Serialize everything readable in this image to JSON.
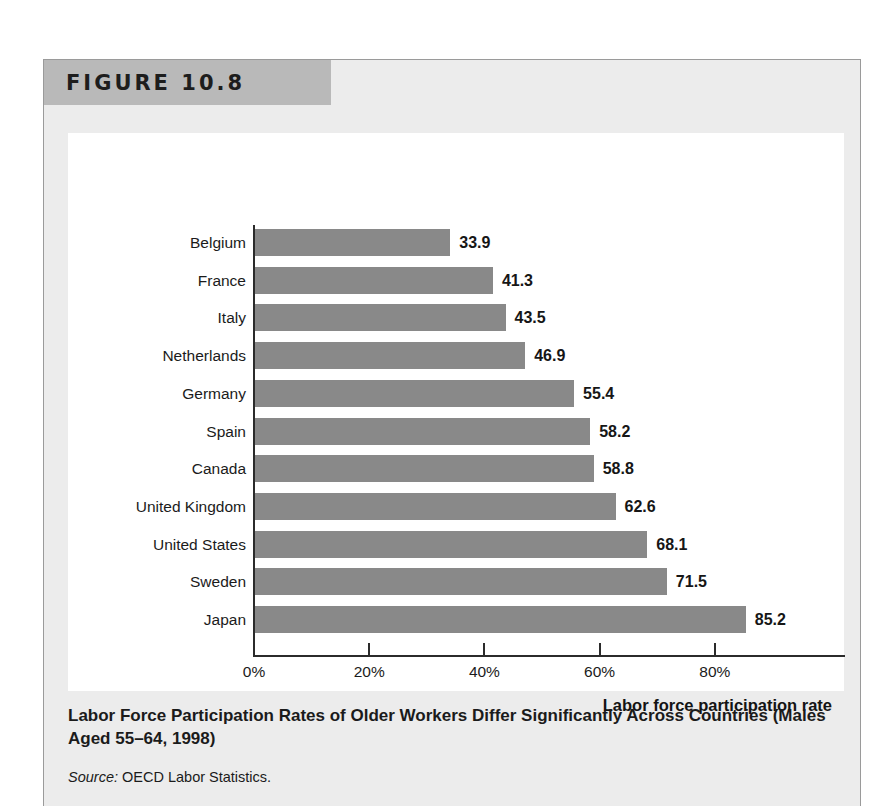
{
  "figure": {
    "number_label": "FIGURE 10.8",
    "caption": "Labor Force Participation Rates of Older Workers Differ Significantly Across Countries (Males Aged 55–64, 1998)",
    "source_prefix": "Source:",
    "source_text": " OECD Labor Statistics."
  },
  "colors": {
    "bar": "#898989",
    "banner": "#b9b9b9",
    "figure_background": "#ececec",
    "plot_background": "#ffffff",
    "axis": "#2b2b2b",
    "text": "#1b1b1b"
  },
  "chart_data": {
    "type": "bar",
    "orientation": "horizontal",
    "title": "",
    "subtitle": "",
    "xlabel": "Labor force participation rate",
    "ylabel": "",
    "xlim": [
      0,
      100
    ],
    "xticks": [
      0,
      20,
      40,
      60,
      80
    ],
    "xticklabels": [
      "0%",
      "20%",
      "40%",
      "60%",
      "80%"
    ],
    "grid": false,
    "legend": false,
    "value_labels": true,
    "categories": [
      "Belgium",
      "France",
      "Italy",
      "Netherlands",
      "Germany",
      "Spain",
      "Canada",
      "United Kingdom",
      "United States",
      "Sweden",
      "Japan"
    ],
    "values": [
      33.9,
      41.3,
      43.5,
      46.9,
      55.4,
      58.2,
      58.8,
      62.6,
      68.1,
      71.5,
      85.2
    ],
    "value_label_texts": [
      "33.9",
      "41.3",
      "43.5",
      "46.9",
      "55.4",
      "58.2",
      "58.8",
      "62.6",
      "68.1",
      "71.5",
      "85.2"
    ],
    "series": [
      {
        "name": "Labor force participation rate",
        "values": [
          33.9,
          41.3,
          43.5,
          46.9,
          55.4,
          58.2,
          58.8,
          62.6,
          68.1,
          71.5,
          85.2
        ]
      }
    ]
  }
}
